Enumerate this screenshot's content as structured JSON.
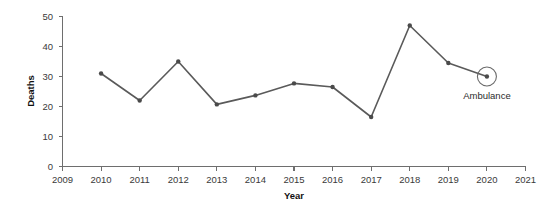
{
  "chart_data": {
    "type": "line",
    "title": "",
    "xlabel": "Year",
    "ylabel": "Deaths",
    "xlim": [
      2009,
      2021
    ],
    "ylim": [
      0,
      50
    ],
    "grid": false,
    "legend": "none",
    "x_ticks": [
      "2009",
      "2010",
      "2011",
      "2012",
      "2013",
      "2014",
      "2015",
      "2016",
      "2017",
      "2018",
      "2019",
      "2020",
      "2021"
    ],
    "y_ticks": [
      "0",
      "10",
      "20",
      "30",
      "40",
      "50"
    ],
    "series": [
      {
        "name": "Ambulance",
        "x": [
          2010,
          2011,
          2012,
          2013,
          2014,
          2015,
          2016,
          2017,
          2018,
          2019,
          2020
        ],
        "values": [
          31,
          22,
          35,
          20.7,
          23.7,
          27.7,
          26.5,
          16.5,
          47,
          34.5,
          30
        ],
        "color": "#5a5a5a"
      }
    ],
    "annotations": [
      {
        "label": "Ambulance",
        "marker": "open-circle",
        "x": 2020,
        "y": 30
      }
    ]
  }
}
